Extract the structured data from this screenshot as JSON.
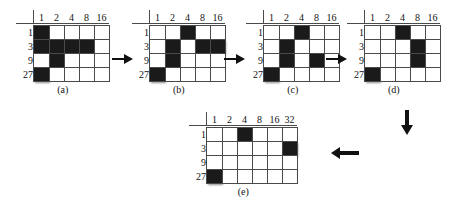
{
  "figure": {
    "background_color": "#ffffff",
    "filled_cell_color": "#1a1a1a",
    "grid_line_color": "#4a4a4a"
  },
  "panels": [
    {
      "id": "panel-a",
      "caption": "(a)",
      "col_headers": [
        "1",
        "2",
        "4",
        "8",
        "16"
      ],
      "row_headers": [
        "1",
        "3",
        "9",
        "27"
      ],
      "filled": [
        [
          true,
          false,
          false,
          false,
          false
        ],
        [
          true,
          true,
          true,
          true,
          false
        ],
        [
          false,
          true,
          false,
          false,
          false
        ],
        [
          true,
          false,
          false,
          false,
          false
        ]
      ]
    },
    {
      "id": "panel-b",
      "caption": "(b)",
      "col_headers": [
        "1",
        "2",
        "4",
        "8",
        "16"
      ],
      "row_headers": [
        "1",
        "3",
        "9",
        "27"
      ],
      "filled": [
        [
          false,
          false,
          true,
          false,
          false
        ],
        [
          false,
          true,
          false,
          true,
          true
        ],
        [
          false,
          true,
          false,
          false,
          false
        ],
        [
          true,
          false,
          false,
          false,
          false
        ]
      ]
    },
    {
      "id": "panel-c",
      "caption": "(c)",
      "col_headers": [
        "1",
        "2",
        "4",
        "8",
        "16"
      ],
      "row_headers": [
        "1",
        "3",
        "9",
        "27"
      ],
      "filled": [
        [
          false,
          false,
          true,
          false,
          false
        ],
        [
          false,
          true,
          false,
          false,
          false
        ],
        [
          false,
          true,
          false,
          true,
          false
        ],
        [
          true,
          false,
          false,
          false,
          false
        ]
      ]
    },
    {
      "id": "panel-d",
      "caption": "(d)",
      "col_headers": [
        "1",
        "2",
        "4",
        "8",
        "16"
      ],
      "row_headers": [
        "1",
        "3",
        "9",
        "27"
      ],
      "filled": [
        [
          false,
          false,
          true,
          false,
          false
        ],
        [
          false,
          false,
          false,
          true,
          false
        ],
        [
          false,
          false,
          false,
          true,
          false
        ],
        [
          true,
          false,
          false,
          false,
          false
        ]
      ]
    },
    {
      "id": "panel-e",
      "caption": "(e)",
      "col_headers": [
        "1",
        "2",
        "4",
        "8",
        "16",
        "32"
      ],
      "row_headers": [
        "1",
        "3",
        "9",
        "27"
      ],
      "filled": [
        [
          false,
          false,
          true,
          false,
          false,
          false
        ],
        [
          false,
          false,
          false,
          false,
          false,
          true
        ],
        [
          false,
          false,
          false,
          false,
          false,
          false
        ],
        [
          true,
          false,
          false,
          false,
          false,
          false
        ]
      ]
    }
  ],
  "arrows": [
    {
      "id": "arrow-a-to-b",
      "direction": "right"
    },
    {
      "id": "arrow-b-to-c",
      "direction": "right"
    },
    {
      "id": "arrow-c-to-d",
      "direction": "right"
    },
    {
      "id": "arrow-d-to-e-down",
      "direction": "down"
    },
    {
      "id": "arrow-down-to-e-left",
      "direction": "left"
    }
  ]
}
